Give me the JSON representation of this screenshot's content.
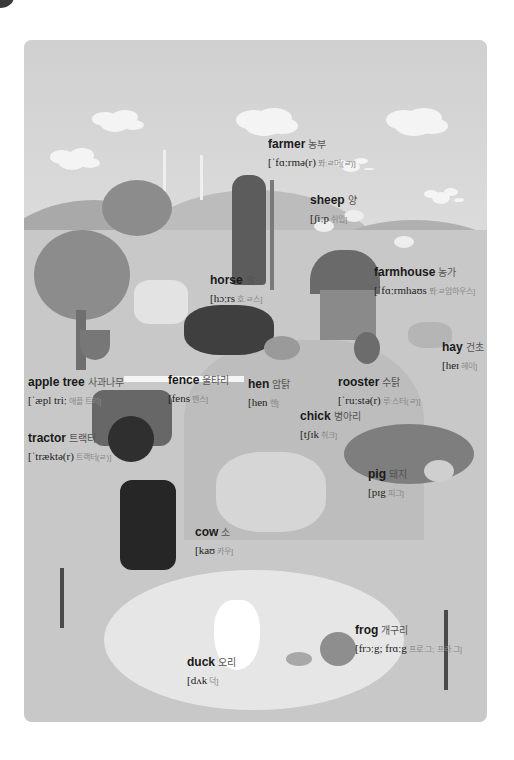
{
  "poster": {
    "theme": "farm vocabulary",
    "colors": {
      "sky": "#d0d0d0",
      "ground": "#c8c8c8",
      "pond": "#e6e6e6",
      "text": "#1a1a1a",
      "korean": "#555555"
    }
  },
  "labels": [
    {
      "id": "farmer",
      "word": "farmer",
      "korean": "농부",
      "ipa": "[ˈfɑːrmə(r)",
      "ipa_korean": "퐈ːㄹ머(ㄹ)]"
    },
    {
      "id": "sheep",
      "word": "sheep",
      "korean": "양",
      "ipa": "[ʃiːp",
      "ipa_korean": "쉬입]"
    },
    {
      "id": "horse",
      "word": "horse",
      "korean": "말",
      "ipa": "[hɔːrs",
      "ipa_korean": "호ːㄹ스]"
    },
    {
      "id": "farmhouse",
      "word": "farmhouse",
      "korean": "농가",
      "ipa": "[ˈfɑːrmhaʊs",
      "ipa_korean": "퐈ːㄹ암하우스]"
    },
    {
      "id": "hay",
      "word": "hay",
      "korean": "건초",
      "ipa": "[heɪ",
      "ipa_korean": "헤이]"
    },
    {
      "id": "apple-tree",
      "word": "apple tree",
      "korean": "사과나무",
      "ipa": "[ˈæpl triː",
      "ipa_korean": "애플 트리]"
    },
    {
      "id": "fence",
      "word": "fence",
      "korean": "울타리",
      "ipa": "[fens",
      "ipa_korean": "펜스]"
    },
    {
      "id": "hen",
      "word": "hen",
      "korean": "암탉",
      "ipa": "[hen",
      "ipa_korean": "헨]"
    },
    {
      "id": "rooster",
      "word": "rooster",
      "korean": "수탉",
      "ipa": "[ˈruːstə(r)",
      "ipa_korean": "루ː스터(ㄹ)]"
    },
    {
      "id": "chick",
      "word": "chick",
      "korean": "병아리",
      "ipa": "[tʃɪk",
      "ipa_korean": "취크]"
    },
    {
      "id": "tractor",
      "word": "tractor",
      "korean": "트랙터",
      "ipa": "[ˈtræktə(r)",
      "ipa_korean": "트랙터(ㄹ)]"
    },
    {
      "id": "pig",
      "word": "pig",
      "korean": "돼지",
      "ipa": "[pɪg",
      "ipa_korean": "피그]"
    },
    {
      "id": "cow",
      "word": "cow",
      "korean": "소",
      "ipa": "[kaʊ",
      "ipa_korean": "카우]"
    },
    {
      "id": "frog",
      "word": "frog",
      "korean": "개구리",
      "ipa": "[frɔːg; frɑːg",
      "ipa_korean": "프로ː그; 프라ː그]"
    },
    {
      "id": "duck",
      "word": "duck",
      "korean": "오리",
      "ipa": "[dʌk",
      "ipa_korean": "덕]"
    }
  ]
}
